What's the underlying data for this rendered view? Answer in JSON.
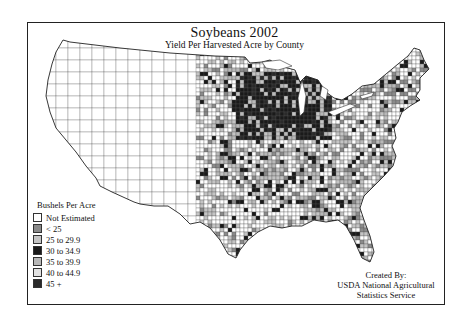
{
  "map": {
    "title": "Soybeans 2002",
    "subtitle": "Yield Per Harvested Acre by County",
    "legend": {
      "title": "Bushels Per Acre",
      "items": [
        {
          "label": "Not Estimated",
          "color": "#ffffff"
        },
        {
          "label": "< 25",
          "color": "#8a8a8a"
        },
        {
          "label": "25 to 29.9",
          "color": "#c4c4c4"
        },
        {
          "label": "30 to 34.9",
          "color": "#1a1a1a"
        },
        {
          "label": "35 to 39.9",
          "color": "#b8b8b8"
        },
        {
          "label": "40 to 44.9",
          "color": "#e2e2e2"
        },
        {
          "label": "45 +",
          "color": "#2a2a2a"
        }
      ]
    },
    "credit": {
      "line1": "Created By:",
      "line2": "USDA National Agricultural",
      "line3": "Statistics Service"
    }
  }
}
